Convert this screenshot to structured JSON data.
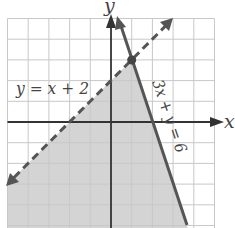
{
  "figure": {
    "type": "system-of-linear-inequalities-graph",
    "axes": {
      "x_label": "x",
      "y_label": "y",
      "x_range": [
        -5,
        5
      ],
      "y_range": [
        -5,
        5
      ],
      "grid_step": 1,
      "origin_px": [
        111,
        122
      ],
      "unit_px": 20.7
    },
    "lines": [
      {
        "id": "line-1",
        "equation_label": "y = x + 2",
        "style": "dashed",
        "endpoints": [
          [
            -5,
            -3
          ],
          [
            3,
            5
          ]
        ],
        "color": "#555555"
      },
      {
        "id": "line-2",
        "equation_label": "3x + y = 6",
        "style": "solid",
        "endpoints": [
          [
            0.33,
            5
          ],
          [
            3.7,
            -5.1
          ]
        ],
        "color": "#555555"
      }
    ],
    "intersection_point": {
      "x": 1,
      "y": 3
    },
    "shaded_region": {
      "description": "y < x + 2 and 3x + y <= 6",
      "vertices": [
        [
          -5,
          -3
        ],
        [
          1,
          3
        ],
        [
          3.7,
          -5.1
        ],
        [
          -5,
          -5.1
        ]
      ],
      "color": "#d4d4d4"
    },
    "colors": {
      "grid": "#c8c8c8",
      "axis": "#333333",
      "shade": "#d4d4d4",
      "line": "#555555",
      "label": "#444444"
    }
  }
}
